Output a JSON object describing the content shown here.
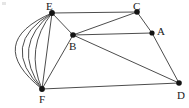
{
  "figure": {
    "background_color": "#ffffff",
    "edge_color": "#4d4d4d",
    "vertex_color": "#141414",
    "label_color": "#1a1a1a",
    "width": 189,
    "height": 108,
    "corner_mark": ""
  },
  "vertices": [
    {
      "id": "A",
      "label": "A",
      "x": 152,
      "y": 33,
      "label_x": 157,
      "label_y": 26,
      "radius": 2.6
    },
    {
      "id": "B",
      "label": "B",
      "x": 73,
      "y": 35,
      "label_x": 69,
      "label_y": 41,
      "radius": 2.8
    },
    {
      "id": "C",
      "label": "C",
      "x": 137,
      "y": 12,
      "label_x": 133,
      "label_y": 1,
      "radius": 2.8
    },
    {
      "id": "D",
      "label": "D",
      "x": 179,
      "y": 83,
      "label_x": 177,
      "label_y": 90,
      "radius": 2.8
    },
    {
      "id": "E",
      "label": "E",
      "x": 52,
      "y": 13,
      "label_x": 46,
      "label_y": 1,
      "radius": 2.9
    },
    {
      "id": "F",
      "label": "F",
      "x": 42,
      "y": 89,
      "label_x": 39,
      "label_y": 94,
      "radius": 2.9
    }
  ],
  "edges": [
    {
      "from": "E",
      "to": "C",
      "type": "straight"
    },
    {
      "from": "E",
      "to": "B",
      "type": "straight"
    },
    {
      "from": "E",
      "to": "F",
      "type": "straight"
    },
    {
      "from": "B",
      "to": "C",
      "type": "straight"
    },
    {
      "from": "B",
      "to": "A",
      "type": "straight"
    },
    {
      "from": "B",
      "to": "F",
      "type": "straight"
    },
    {
      "from": "B",
      "to": "D",
      "type": "straight"
    },
    {
      "from": "C",
      "to": "A",
      "type": "straight"
    },
    {
      "from": "A",
      "to": "D",
      "type": "straight"
    },
    {
      "from": "F",
      "to": "D",
      "type": "straight"
    },
    {
      "from": "E",
      "to": "F",
      "type": "arc",
      "bulge": 18,
      "index": 1
    },
    {
      "from": "E",
      "to": "F",
      "type": "arc",
      "bulge": 29,
      "index": 2
    },
    {
      "from": "E",
      "to": "F",
      "type": "arc",
      "bulge": 39,
      "index": 3
    },
    {
      "from": "E",
      "to": "F",
      "type": "arc",
      "bulge": 50,
      "index": 4
    }
  ],
  "counts": {
    "vertices": 6,
    "edges": 14,
    "parallel_edges_E_F": 5
  }
}
